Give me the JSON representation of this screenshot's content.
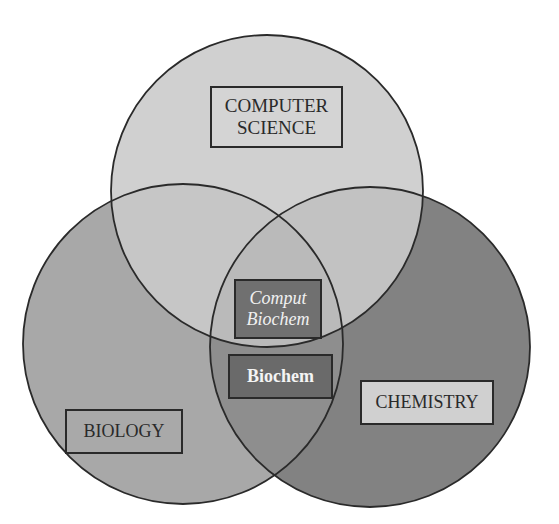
{
  "diagram": {
    "type": "venn",
    "sets": [
      {
        "name": "computer-science",
        "label_lines": [
          "COMPUTER",
          "SCIENCE"
        ],
        "fill": "#d0d0d0"
      },
      {
        "name": "biology",
        "label_lines": [
          "BIOLOGY"
        ],
        "fill": "#a8a8a8"
      },
      {
        "name": "chemistry",
        "label_lines": [
          "CHEMISTRY"
        ],
        "fill": "#828282"
      }
    ],
    "intersections": [
      {
        "name": "computational-biochemistry",
        "sets": [
          "computer-science",
          "biology",
          "chemistry"
        ],
        "label_lines": [
          "Comput",
          "Biochem"
        ]
      },
      {
        "name": "biochemistry",
        "sets": [
          "biology",
          "chemistry"
        ],
        "label_lines": [
          "Biochem"
        ]
      }
    ],
    "colors": {
      "outline": "#2a2a2a",
      "top_only": "#d0d0d0",
      "left_only": "#a8a8a8",
      "right_only": "#828282",
      "top_left": "#c4c4c4",
      "top_right": "#c2c2c2",
      "left_right": "#8e8e8e",
      "center": "#b8b8b8"
    }
  }
}
